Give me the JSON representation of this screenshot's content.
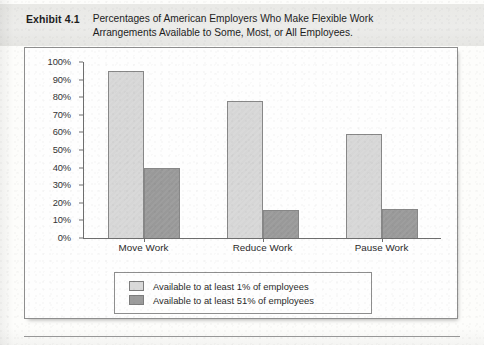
{
  "header": {
    "exhibit_label": "Exhibit 4.1",
    "title": "Percentages of American Employers Who Make Flexible Work Arrangements Available to Some, Most, or All Employees."
  },
  "colors": {
    "series_a": "#d9d9d9",
    "series_b": "#9c9c9c",
    "axis": "#6e6e6e",
    "border": "#8e8e8e",
    "header_band": "#ececea"
  },
  "chart_data": {
    "type": "bar",
    "title": "Percentages of American Employers Who Make Flexible Work Arrangements Available to Some, Most, or All Employees.",
    "xlabel": "",
    "ylabel": "",
    "ylim": [
      0,
      100
    ],
    "yticks": [
      "0%",
      "10%",
      "20%",
      "30%",
      "40%",
      "50%",
      "60%",
      "70%",
      "80%",
      "90%",
      "100%"
    ],
    "ytick_values": [
      0,
      10,
      20,
      30,
      40,
      50,
      60,
      70,
      80,
      90,
      100
    ],
    "grid": false,
    "legend_position": "bottom",
    "categories": [
      "Move Work",
      "Reduce Work",
      "Pause Work"
    ],
    "series": [
      {
        "name": "Available to at least 1% of employees",
        "color": "#d9d9d9",
        "values": [
          95,
          78,
          59
        ]
      },
      {
        "name": "Available to at least 51% of employees",
        "color": "#9c9c9c",
        "values": [
          40,
          16,
          16.5
        ]
      }
    ]
  }
}
